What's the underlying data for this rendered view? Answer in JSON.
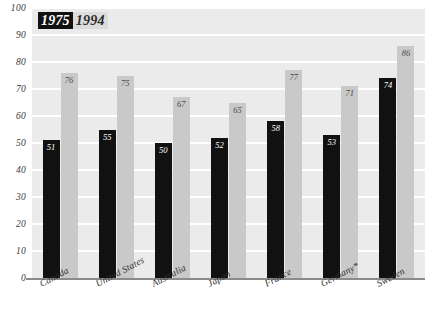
{
  "chart_data": {
    "type": "bar",
    "title": "",
    "subtitle": "",
    "xlabel": "",
    "ylabel": "",
    "ylim": [
      0,
      100
    ],
    "ytick_step": 10,
    "yticks": [
      100,
      90,
      80,
      70,
      60,
      50,
      40,
      30,
      20,
      10,
      0
    ],
    "grid": "horizontal",
    "legend_position": "top-left",
    "categories": [
      "Canada",
      "United States",
      "Australia",
      "Japan",
      "France",
      "Germany*",
      "Sweden"
    ],
    "series": [
      {
        "name": "1975",
        "color": "#111111",
        "values": [
          51,
          55,
          50,
          52,
          58,
          53,
          74
        ]
      },
      {
        "name": "1994",
        "color": "#c9c9c9",
        "values": [
          76,
          75,
          67,
          65,
          77,
          71,
          86
        ]
      }
    ],
    "value_labels": {
      "1975": [
        "51",
        "55",
        "50",
        "52",
        "58",
        "53",
        "74"
      ],
      "1994": [
        "76",
        "75",
        "67",
        "65",
        "77",
        "71",
        "86"
      ]
    },
    "annotations": [
      "Germany* label carries an asterisk footnote marker"
    ]
  },
  "legend": {
    "entries": [
      {
        "label": "1975",
        "swatch": "#111111"
      },
      {
        "label": "1994",
        "swatch": "#dcdcdc"
      }
    ]
  },
  "axes": {
    "y": {
      "ticks": [
        "100",
        "90",
        "80",
        "70",
        "60",
        "50",
        "40",
        "30",
        "20",
        "10",
        "0"
      ]
    },
    "x": {
      "ticks": [
        "Canada",
        "United States",
        "Australia",
        "Japan",
        "France",
        "Germany*",
        "Sweden"
      ]
    }
  },
  "colors": {
    "plot_background": "#ebebeb",
    "gridline": "#ffffff",
    "axis_line": "#8b8b8b",
    "series_1975": "#111111",
    "series_1994": "#c9c9c9",
    "page_background": "#ffffff"
  }
}
